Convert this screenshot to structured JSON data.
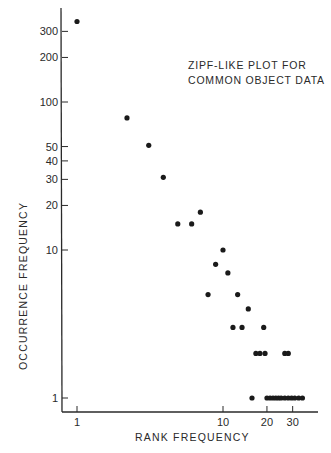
{
  "chart_data": {
    "type": "scatter",
    "title": "ZIPF-LIKE PLOT FOR COMMON OBJECT DATA",
    "title_lines": [
      "ZIPF-LIKE PLOT FOR",
      "COMMON OBJECT DATA"
    ],
    "xlabel": "RANK FREQUENCY",
    "ylabel": "OCCURRENCE FREQUENCY",
    "xscale": "log",
    "yscale": "log",
    "xlim": [
      0.9,
      40
    ],
    "ylim": [
      0.85,
      400
    ],
    "grid": false,
    "legend": null,
    "x_ticks": [
      1,
      10,
      20,
      30
    ],
    "x_tick_labels": [
      "1",
      "10",
      "20",
      "30"
    ],
    "y_ticks": [
      1,
      10,
      20,
      30,
      40,
      50,
      100,
      200,
      300
    ],
    "y_tick_labels": [
      "1",
      "10",
      "20",
      "30",
      "40",
      "50",
      "100",
      "200",
      "300"
    ],
    "points": [
      {
        "x": 1,
        "y": 350
      },
      {
        "x": 2.2,
        "y": 78
      },
      {
        "x": 3.1,
        "y": 51
      },
      {
        "x": 3.9,
        "y": 31
      },
      {
        "x": 4.9,
        "y": 15
      },
      {
        "x": 6.1,
        "y": 15
      },
      {
        "x": 7,
        "y": 18
      },
      {
        "x": 7.9,
        "y": 5
      },
      {
        "x": 8.9,
        "y": 8
      },
      {
        "x": 10,
        "y": 10
      },
      {
        "x": 10.8,
        "y": 7
      },
      {
        "x": 11.7,
        "y": 3
      },
      {
        "x": 12.6,
        "y": 5
      },
      {
        "x": 13.5,
        "y": 3
      },
      {
        "x": 14.9,
        "y": 4
      },
      {
        "x": 15.8,
        "y": 1
      },
      {
        "x": 16.8,
        "y": 2
      },
      {
        "x": 17.9,
        "y": 2
      },
      {
        "x": 19,
        "y": 3
      },
      {
        "x": 19.4,
        "y": 2
      },
      {
        "x": 20,
        "y": 1
      },
      {
        "x": 21,
        "y": 1
      },
      {
        "x": 22,
        "y": 1
      },
      {
        "x": 23,
        "y": 1
      },
      {
        "x": 24,
        "y": 1
      },
      {
        "x": 25,
        "y": 1
      },
      {
        "x": 26.5,
        "y": 2
      },
      {
        "x": 26.5,
        "y": 1
      },
      {
        "x": 28,
        "y": 2
      },
      {
        "x": 28,
        "y": 1
      },
      {
        "x": 29.5,
        "y": 1
      },
      {
        "x": 31,
        "y": 1
      },
      {
        "x": 33,
        "y": 1
      },
      {
        "x": 35,
        "y": 1
      }
    ]
  },
  "colors": {
    "ink": "#1a1a1a",
    "background": "#ffffff"
  }
}
